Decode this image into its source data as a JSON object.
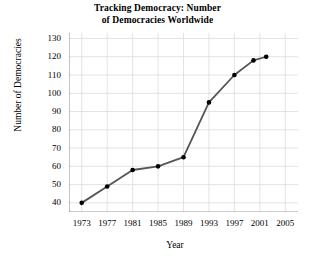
{
  "chart_data": {
    "type": "line",
    "title": "Tracking Democracy: Number of Democracies Worldwide",
    "title_line1": "Tracking Democracy: Number",
    "title_line2": "of Democracies Worldwide",
    "xlabel": "Year",
    "ylabel": "Number of Democracies",
    "xlim": [
      1971,
      2007
    ],
    "ylim": [
      35,
      133
    ],
    "xticks": [
      1973,
      1977,
      1981,
      1985,
      1989,
      1993,
      1997,
      2001,
      2005
    ],
    "yticks": [
      40,
      50,
      60,
      70,
      80,
      90,
      100,
      110,
      120,
      130
    ],
    "grid": true,
    "legend": "none",
    "axis_break": "y-axis break below 40",
    "series": [
      {
        "name": "Number of Democracies Worldwide",
        "x": [
          1973,
          1977,
          1981,
          1985,
          1989,
          1993,
          1997,
          2000,
          2002
        ],
        "values": [
          40,
          49,
          58,
          60,
          65,
          95,
          110,
          118,
          120
        ],
        "line_color": "#555555",
        "marker_color": "#000000",
        "marker": "circle"
      }
    ]
  },
  "colors": {
    "background": "#ffffff",
    "grid": "#dcdcdc",
    "axis": "#9a9a9a",
    "line": "#555555",
    "marker": "#000000",
    "text": "#000000"
  }
}
